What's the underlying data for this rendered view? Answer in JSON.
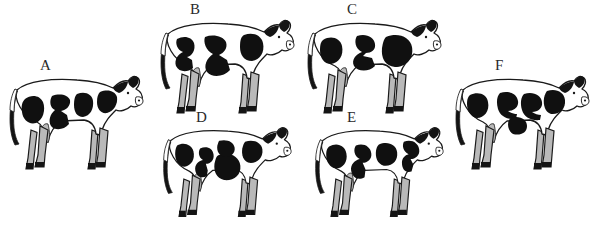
{
  "figure": {
    "name": "cow-spot-pattern-figure",
    "background_color": "#ffffff",
    "outline_color": "#1a1a1a",
    "spot_color": "#101010",
    "shade_color": "#b3b3b3",
    "label_color": "#2a2a2a",
    "width": 589,
    "height": 227
  },
  "cows": [
    {
      "id": "A",
      "label": "A",
      "label_x": 40,
      "label_y": 58,
      "x": 2,
      "y": 60,
      "width": 145,
      "height": 120,
      "spot_count": 4,
      "spot_description": "rear oval, center chevron, vertical blob, shoulder triangle"
    },
    {
      "id": "B",
      "label": "B",
      "label_x": 190,
      "label_y": 2,
      "x": 153,
      "y": 4,
      "width": 145,
      "height": 120,
      "spot_count": 4,
      "spot_description": "rear hook, center chevron, lower triangle, shoulder oval"
    },
    {
      "id": "C",
      "label": "C",
      "label_x": 347,
      "label_y": 2,
      "x": 300,
      "y": 4,
      "width": 145,
      "height": 120,
      "spot_count": 4,
      "spot_description": "rear oval, C-hook, lower wedge, large shoulder blob"
    },
    {
      "id": "D",
      "label": "D",
      "label_x": 196,
      "label_y": 110,
      "x": 153,
      "y": 112,
      "width": 145,
      "height": 115,
      "spot_count": 4,
      "spot_description": "rear oval, L-hook, big center oval, shoulder triangle"
    },
    {
      "id": "E",
      "label": "E",
      "label_x": 347,
      "label_y": 110,
      "x": 305,
      "y": 112,
      "width": 145,
      "height": 115,
      "spot_count": 4,
      "spot_description": "rear oval, comma hook, center triangle, shoulder hook"
    },
    {
      "id": "F",
      "label": "F",
      "label_x": 495,
      "label_y": 58,
      "x": 448,
      "y": 60,
      "width": 145,
      "height": 120,
      "spot_count": 5,
      "spot_description": "rear oval, upper C, mid C, lower blob, shoulder triangle"
    }
  ]
}
